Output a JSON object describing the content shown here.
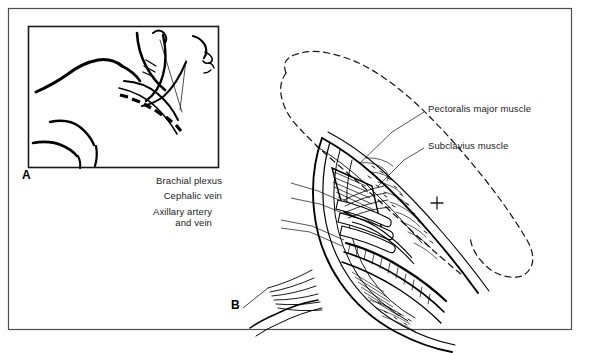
{
  "figure": {
    "type": "anatomical-line-illustration",
    "panels": [
      {
        "letter": "A",
        "name": "orientation-inset",
        "description": "Profile line drawing of head, neck and shoulder showing the dashed incision line below the clavicle"
      },
      {
        "letter": "B",
        "name": "dissection-view",
        "description": "Magnified dissection of the infraclavicular fossa with reflected skin flap shown as a dashed outline"
      }
    ],
    "labels": [
      {
        "id": "pectoralis-major",
        "text": "Pectoralis major muscle",
        "align": "left",
        "x": 428,
        "y": 108
      },
      {
        "id": "subclavius",
        "text": "Subclavius muscle",
        "align": "left",
        "x": 428,
        "y": 145
      },
      {
        "id": "brachial-plexus",
        "text": "Brachial plexus",
        "align": "right",
        "x": 222,
        "y": 180
      },
      {
        "id": "cephalic-vein",
        "text": "Cephalic vein",
        "align": "right",
        "x": 222,
        "y": 195
      },
      {
        "id": "axillary-artery-and-vein-line1",
        "text": "Axillary artery",
        "align": "right",
        "x": 212,
        "y": 211
      },
      {
        "id": "axillary-artery-and-vein-line2",
        "text": "and vein",
        "align": "right",
        "x": 212,
        "y": 222
      }
    ],
    "panel_letters": [
      {
        "id": "panel-letter-a",
        "text": "A",
        "x": 22,
        "y": 175
      },
      {
        "id": "panel-letter-b",
        "text": "B",
        "x": 231,
        "y": 304
      }
    ],
    "marks": [
      {
        "id": "plus-mark",
        "symbol": "+",
        "x": 437,
        "y": 203
      }
    ],
    "caption": {
      "text": "",
      "visible": false
    },
    "colors": {
      "ink": "#000000",
      "frame": "#4a4a4a",
      "label_text": "#1a1a1a",
      "background": "#ffffff",
      "dashed_flap": "#1a1a1a"
    },
    "frame": {
      "outer": {
        "x": 8,
        "y": 8,
        "width": 564,
        "height": 322
      },
      "inset": {
        "x": 28,
        "y": 26,
        "width": 190,
        "height": 142
      }
    }
  }
}
